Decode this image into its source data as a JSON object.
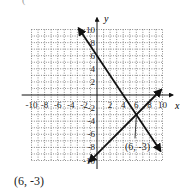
{
  "corner_mark": "(",
  "answer": "(6, -3)",
  "chart_data": {
    "type": "line",
    "title": "",
    "xlabel": "x",
    "ylabel": "y",
    "xlim": [
      -10,
      10
    ],
    "ylim": [
      -10,
      10
    ],
    "grid": true,
    "grid_style": "dotted",
    "x_tick_labels": [
      "-10",
      "-8",
      "-6",
      "-4",
      "-2",
      "2",
      "4",
      "6",
      "8",
      "10"
    ],
    "y_tick_labels": [
      "10",
      "8",
      "6",
      "4",
      "2",
      "-2",
      "-4",
      "-6",
      "-8",
      "-10"
    ],
    "series": [
      {
        "name": "line 1",
        "equation": "y = -1.5x + 6",
        "x": [
          -2.8,
          9.7
        ],
        "y": [
          10.2,
          -8.55
        ],
        "arrows": "both"
      },
      {
        "name": "line 2",
        "equation": "y = x - 9",
        "x": [
          -1.2,
          9.8
        ],
        "y": [
          -10.2,
          0.8
        ],
        "arrows": "both"
      }
    ],
    "annotations": [
      {
        "text": "(6, -3)",
        "x": 6,
        "y": -3,
        "label_position": [
          5.5,
          -8
        ]
      }
    ],
    "intersection": {
      "x": 6,
      "y": -3
    }
  }
}
